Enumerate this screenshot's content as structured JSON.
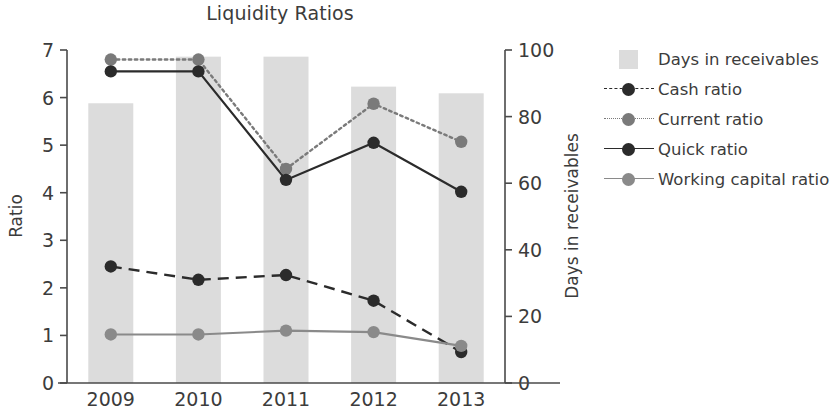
{
  "chart_data": {
    "type": "line",
    "title": "Liquidity Ratios",
    "xlabel": "",
    "ylabel": "Ratio",
    "y2label": "Days in receivables",
    "categories": [
      "2009",
      "2010",
      "2011",
      "2012",
      "2013"
    ],
    "ylim": [
      0,
      7
    ],
    "y2lim": [
      0,
      100
    ],
    "yticks": [
      "0",
      "1",
      "2",
      "3",
      "4",
      "5",
      "6",
      "7"
    ],
    "y2ticks": [
      "0",
      "20",
      "40",
      "60",
      "80",
      "100"
    ],
    "grid": false,
    "legend_position": "right",
    "series": [
      {
        "name": "Days in receivables",
        "type": "bar",
        "axis": "right",
        "color": "#dcdcdc",
        "values": [
          84,
          98,
          98,
          89,
          87
        ]
      },
      {
        "name": "Cash ratio",
        "type": "line",
        "axis": "left",
        "style": "dashed",
        "color": "#2b2b2b",
        "values": [
          2.45,
          2.17,
          2.27,
          1.73,
          0.65
        ]
      },
      {
        "name": "Current ratio",
        "type": "line",
        "axis": "left",
        "style": "dotted",
        "color": "#7a7a7a",
        "values": [
          6.8,
          6.8,
          4.5,
          5.87,
          5.07
        ]
      },
      {
        "name": "Quick ratio",
        "type": "line",
        "axis": "left",
        "style": "solid",
        "color": "#2b2b2b",
        "values": [
          6.55,
          6.55,
          4.27,
          5.05,
          4.02
        ]
      },
      {
        "name": "Working capital ratio",
        "type": "line",
        "axis": "left",
        "style": "solid",
        "color": "#8a8a8a",
        "values": [
          1.02,
          1.02,
          1.1,
          1.07,
          0.78
        ]
      }
    ]
  },
  "legend": {
    "items": [
      {
        "label": "Days in receivables",
        "key": "bar-swatch",
        "color": "#dcdcdc"
      },
      {
        "label": "Cash ratio",
        "key": "dashed-line-marker",
        "color": "#2b2b2b"
      },
      {
        "label": "Current ratio",
        "key": "dotted-line-marker",
        "color": "#7a7a7a"
      },
      {
        "label": "Quick ratio",
        "key": "solid-line-marker",
        "color": "#2b2b2b"
      },
      {
        "label": "Working capital ratio",
        "key": "solid-line-marker",
        "color": "#8a8a8a"
      }
    ]
  }
}
